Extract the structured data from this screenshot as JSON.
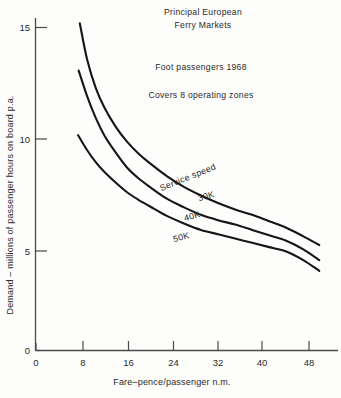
{
  "chart_data": {
    "type": "line",
    "title_line1": "Principal European",
    "title_line2": "Ferry Markets",
    "annotations": [
      "Foot passengers 1968",
      "Covers 8 operating zones"
    ],
    "legend_title": "Service speed",
    "xlabel": "Fare–pence/passenger n.m.",
    "ylabel": "Demand – millions of passenger hours on board p.a.",
    "xlim": [
      0,
      52
    ],
    "ylim": [
      0,
      16.3
    ],
    "xticks": [
      0,
      8,
      16,
      24,
      32,
      40,
      48
    ],
    "xticklabels": [
      "0",
      "8",
      "16",
      "24",
      "32",
      "40",
      "48"
    ],
    "yticks": [
      0,
      5,
      10,
      15
    ],
    "yticklabels": [
      "0",
      "5",
      "10",
      "15"
    ],
    "grid": false,
    "legend_position": "inline-on-curves",
    "series": [
      {
        "name": "30K",
        "label": "30K",
        "color": "#16161a",
        "x": [
          7.7,
          9,
          10.5,
          12,
          14,
          16,
          18,
          20,
          23,
          26,
          29,
          32,
          35,
          38,
          41,
          44,
          47,
          49.8
        ],
        "y": [
          15.2,
          13.5,
          12.2,
          11.3,
          10.4,
          9.7,
          9.15,
          8.7,
          8.1,
          7.6,
          7.2,
          6.85,
          6.55,
          6.3,
          6.0,
          5.7,
          5.3,
          4.9
        ]
      },
      {
        "name": "40K",
        "label": "40K",
        "color": "#16161a",
        "x": [
          7.5,
          9,
          10.5,
          12,
          14,
          16,
          18,
          20,
          23,
          26,
          29,
          32,
          35,
          38,
          41,
          44,
          47,
          49.8
        ],
        "y": [
          13.0,
          11.8,
          10.8,
          10.0,
          9.2,
          8.5,
          8.0,
          7.6,
          7.05,
          6.65,
          6.3,
          6.05,
          5.85,
          5.6,
          5.35,
          5.1,
          4.7,
          4.2
        ]
      },
      {
        "name": "50K",
        "label": "50K",
        "color": "#16161a",
        "x": [
          7.4,
          9,
          10.5,
          12,
          14,
          16,
          18,
          20,
          23,
          26,
          29,
          32,
          35,
          38,
          41,
          44,
          47,
          49.8
        ],
        "y": [
          10.0,
          9.3,
          8.75,
          8.3,
          7.8,
          7.35,
          7.0,
          6.7,
          6.25,
          5.9,
          5.6,
          5.4,
          5.2,
          5.0,
          4.8,
          4.6,
          4.2,
          3.7
        ]
      }
    ]
  }
}
